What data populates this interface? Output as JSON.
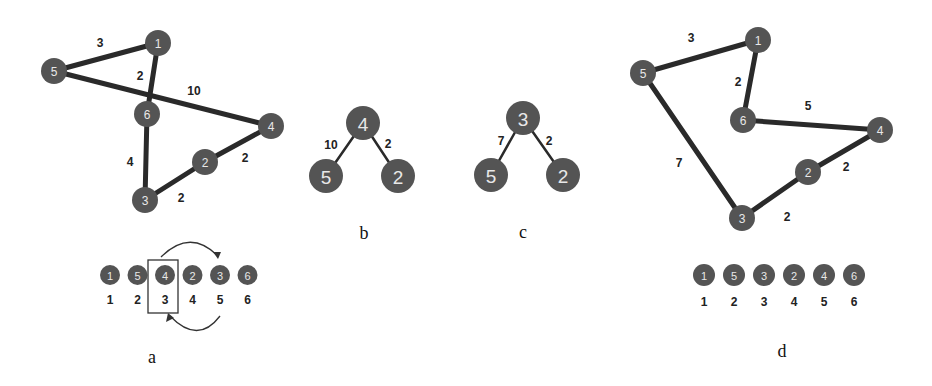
{
  "figure": {
    "panels": [
      {
        "id": "a",
        "label": "a",
        "graph": {
          "nodes": [
            {
              "id": "1",
              "x": 158,
              "y": 43
            },
            {
              "id": "5",
              "x": 54,
              "y": 71
            },
            {
              "id": "6",
              "x": 147,
              "y": 114
            },
            {
              "id": "4",
              "x": 271,
              "y": 126
            },
            {
              "id": "2",
              "x": 205,
              "y": 162
            },
            {
              "id": "3",
              "x": 145,
              "y": 200
            }
          ],
          "edges": [
            {
              "from": "5",
              "to": "1",
              "weight": "3",
              "lx": 100,
              "ly": 43
            },
            {
              "from": "1",
              "to": "6",
              "weight": "2",
              "lx": 140,
              "ly": 76
            },
            {
              "from": "5",
              "to": "4",
              "weight": "10",
              "lx": 194,
              "ly": 91
            },
            {
              "from": "6",
              "to": "3",
              "weight": "4",
              "lx": 130,
              "ly": 162
            },
            {
              "from": "3",
              "to": "2",
              "weight": "2",
              "lx": 181,
              "ly": 198
            },
            {
              "from": "2",
              "to": "4",
              "weight": "2",
              "lx": 245,
              "ly": 158
            }
          ]
        },
        "array": {
          "values": [
            "1",
            "5",
            "4",
            "2",
            "3",
            "6"
          ],
          "positions": [
            "1",
            "2",
            "3",
            "4",
            "5",
            "6"
          ],
          "highlighted_index": 2
        }
      },
      {
        "id": "b",
        "label": "b",
        "graph": {
          "nodes": [
            {
              "id": "4",
              "x": 363,
              "y": 123
            },
            {
              "id": "5",
              "x": 326,
              "y": 176
            },
            {
              "id": "2",
              "x": 398,
              "y": 176
            }
          ],
          "edges": [
            {
              "from": "4",
              "to": "5",
              "weight": "10",
              "lx": 331,
              "ly": 145
            },
            {
              "from": "4",
              "to": "2",
              "weight": "2",
              "lx": 388,
              "ly": 144
            }
          ]
        }
      },
      {
        "id": "c",
        "label": "c",
        "graph": {
          "nodes": [
            {
              "id": "3",
              "x": 523,
              "y": 118
            },
            {
              "id": "5",
              "x": 491,
              "y": 175
            },
            {
              "id": "2",
              "x": 563,
              "y": 175
            }
          ],
          "edges": [
            {
              "from": "3",
              "to": "5",
              "weight": "7",
              "lx": 501,
              "ly": 141
            },
            {
              "from": "3",
              "to": "2",
              "weight": "2",
              "lx": 549,
              "ly": 141
            }
          ]
        }
      },
      {
        "id": "d",
        "label": "d",
        "graph": {
          "nodes": [
            {
              "id": "1",
              "x": 758,
              "y": 40
            },
            {
              "id": "5",
              "x": 643,
              "y": 73
            },
            {
              "id": "6",
              "x": 743,
              "y": 120
            },
            {
              "id": "4",
              "x": 880,
              "y": 130
            },
            {
              "id": "2",
              "x": 808,
              "y": 172
            },
            {
              "id": "3",
              "x": 742,
              "y": 218
            }
          ],
          "edges": [
            {
              "from": "5",
              "to": "1",
              "weight": "3",
              "lx": 691,
              "ly": 38
            },
            {
              "from": "1",
              "to": "6",
              "weight": "2",
              "lx": 738,
              "ly": 82
            },
            {
              "from": "6",
              "to": "4",
              "weight": "5",
              "lx": 808,
              "ly": 106
            },
            {
              "from": "5",
              "to": "3",
              "weight": "7",
              "lx": 679,
              "ly": 163
            },
            {
              "from": "3",
              "to": "2",
              "weight": "2",
              "lx": 787,
              "ly": 217
            },
            {
              "from": "2",
              "to": "4",
              "weight": "2",
              "lx": 846,
              "ly": 167
            }
          ]
        },
        "array": {
          "values": [
            "1",
            "5",
            "3",
            "2",
            "4",
            "6"
          ],
          "positions": [
            "1",
            "2",
            "3",
            "4",
            "5",
            "6"
          ]
        }
      }
    ],
    "colors": {
      "node_fill": "#545454",
      "node_text": "#e8e8e8",
      "edge": "#2a2a2a",
      "text": "#222222"
    }
  }
}
